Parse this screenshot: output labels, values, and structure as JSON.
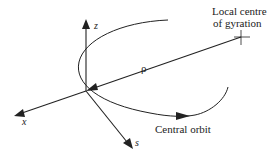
{
  "diagram": {
    "colors": {
      "line": "#222222",
      "background": "#ffffff"
    },
    "axes": {
      "z": {
        "label": "z"
      },
      "x": {
        "label": "x"
      },
      "s": {
        "label": "s"
      }
    },
    "rho": {
      "label": "ρ"
    },
    "local_centre": {
      "line1": "Local centre",
      "line2": "of gyration"
    },
    "orbit": {
      "label": "Central orbit"
    }
  }
}
